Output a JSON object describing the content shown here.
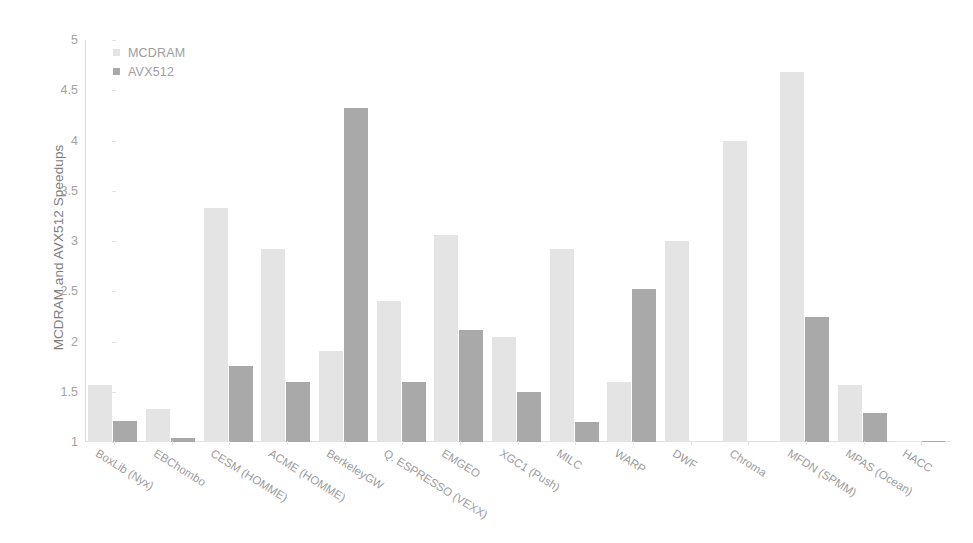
{
  "chart_data": {
    "type": "bar",
    "title": "",
    "xlabel": "",
    "ylabel": "MCDRAM and AVX512 Speedups",
    "ylim": [
      1,
      5
    ],
    "yticks": [
      1,
      1.5,
      2,
      2.5,
      3,
      3.5,
      4,
      4.5,
      5
    ],
    "ytick_labels": [
      "1",
      "1.5",
      "2",
      "2.5",
      "3",
      "3.5",
      "4",
      "4.5",
      "5"
    ],
    "grid": false,
    "legend_position": "top-left",
    "categories": [
      "BoxLib (Nyx)",
      "EBChombo",
      "CESM (HOMME)",
      "ACME (HOMME)",
      "BerkeleyGW",
      "Q. ESPRESSO (VEXX)",
      "EMGEO",
      "XGC1 (Push)",
      "MILC",
      "WARP",
      "DWF",
      "Chroma",
      "MFDN (SPMM)",
      "MPAS (Ocean)",
      "HACC"
    ],
    "series": [
      {
        "name": "MCDRAM",
        "color": "#e4e4e4",
        "values": [
          1.57,
          1.33,
          3.33,
          2.92,
          1.91,
          2.4,
          3.06,
          2.04,
          2.92,
          1.6,
          3.0,
          4.0,
          4.68,
          1.57,
          1.0
        ]
      },
      {
        "name": "AVX512",
        "color": "#a9a9a9",
        "values": [
          1.21,
          1.04,
          1.76,
          1.6,
          4.32,
          1.6,
          2.11,
          1.5,
          1.2,
          2.52,
          null,
          null,
          2.24,
          1.29,
          1.0
        ]
      }
    ]
  },
  "legend": {
    "items": [
      {
        "label": "MCDRAM",
        "swatch": "mcdram"
      },
      {
        "label": "AVX512",
        "swatch": "avx512"
      }
    ]
  }
}
